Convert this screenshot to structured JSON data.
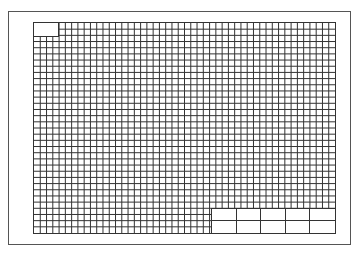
{
  "sheet": {
    "type": "grid-paper-drawing-sheet",
    "grid": {
      "columns": 48,
      "rows": 34,
      "line_color": "#333333",
      "background": "#ffffff"
    },
    "frame_color": "#555555",
    "label_box": {
      "text": ""
    },
    "title_block": {
      "columns": 5,
      "rows": 2,
      "cells": [
        "",
        "",
        "",
        "",
        "",
        "",
        "",
        "",
        "",
        ""
      ]
    }
  }
}
